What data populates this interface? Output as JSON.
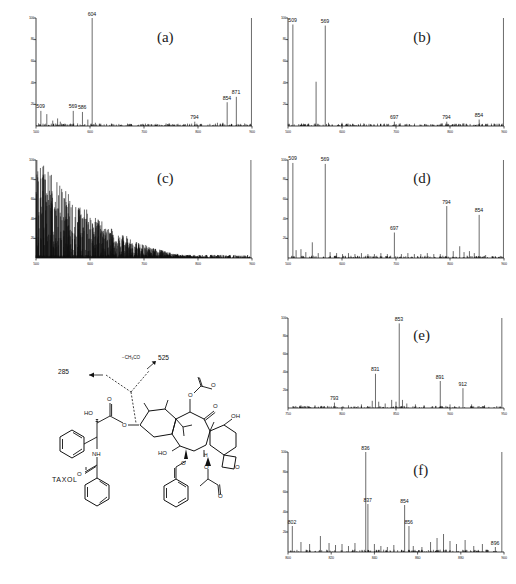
{
  "figure": {
    "kind": "mass-spectra-figure",
    "background": "#ffffff",
    "trace_color": "#111111",
    "axis_color": "#111111"
  },
  "structure": {
    "name": "TAXOL",
    "annotations": [
      {
        "name": "fragment-285",
        "text": "285"
      },
      {
        "name": "fragment-525",
        "text": "525"
      },
      {
        "name": "neutral-loss",
        "text": "−CH₃CO"
      }
    ],
    "atom_labels": [
      "HO",
      "O",
      "O",
      "O",
      "NH",
      "O",
      "OH",
      "O",
      "HO",
      "H",
      "O",
      "O",
      "O",
      "O",
      "O"
    ]
  },
  "panels": [
    {
      "id": "a",
      "label": "(a)",
      "xlabel": "",
      "ylabel": "",
      "xlim": [
        500,
        900
      ],
      "ylim": [
        0,
        100
      ],
      "xticks": [
        500,
        600,
        700,
        800,
        900
      ],
      "xticklabels": [
        "500",
        "600",
        "700",
        "800",
        "900"
      ],
      "yticks": [
        0,
        20,
        40,
        60,
        80,
        100
      ],
      "yticklabels": [
        "",
        "20",
        "40",
        "60",
        "80",
        "100"
      ],
      "labeled_peaks": [
        {
          "mz": 509,
          "intensity": 14
        },
        {
          "mz": 569,
          "intensity": 14
        },
        {
          "mz": 586,
          "intensity": 13
        },
        {
          "mz": 604,
          "intensity": 100
        },
        {
          "mz": 794,
          "intensity": 4
        },
        {
          "mz": 854,
          "intensity": 22
        },
        {
          "mz": 871,
          "intensity": 27
        }
      ],
      "unlabeled_peaks": [
        {
          "mz": 520,
          "intensity": 11
        },
        {
          "mz": 531,
          "intensity": 5
        },
        {
          "mz": 540,
          "intensity": 7
        },
        {
          "mz": 545,
          "intensity": 4
        },
        {
          "mz": 596,
          "intensity": 6
        },
        {
          "mz": 610,
          "intensity": 3
        },
        {
          "mz": 640,
          "intensity": 2
        },
        {
          "mz": 672,
          "intensity": 1
        },
        {
          "mz": 700,
          "intensity": 1
        },
        {
          "mz": 722,
          "intensity": 1
        },
        {
          "mz": 755,
          "intensity": 1
        },
        {
          "mz": 775,
          "intensity": 1
        },
        {
          "mz": 806,
          "intensity": 2
        },
        {
          "mz": 822,
          "intensity": 2
        },
        {
          "mz": 836,
          "intensity": 3
        },
        {
          "mz": 846,
          "intensity": 3
        },
        {
          "mz": 862,
          "intensity": 2
        },
        {
          "mz": 899,
          "intensity": 100
        }
      ]
    },
    {
      "id": "b",
      "label": "(b)",
      "xlim": [
        500,
        900
      ],
      "ylim": [
        0,
        100
      ],
      "xticks": [
        500,
        600,
        700,
        800,
        900
      ],
      "xticklabels": [
        "500",
        "600",
        "700",
        "800",
        "900"
      ],
      "yticks": [
        0,
        20,
        40,
        60,
        80,
        100
      ],
      "yticklabels": [
        "",
        "20",
        "40",
        "60",
        "80",
        "100"
      ],
      "labeled_peaks": [
        {
          "mz": 509,
          "intensity": 94
        },
        {
          "mz": 569,
          "intensity": 93
        },
        {
          "mz": 697,
          "intensity": 4
        },
        {
          "mz": 794,
          "intensity": 4
        },
        {
          "mz": 854,
          "intensity": 6
        }
      ],
      "unlabeled_peaks": [
        {
          "mz": 552,
          "intensity": 41
        },
        {
          "mz": 575,
          "intensity": 3
        },
        {
          "mz": 600,
          "intensity": 3
        },
        {
          "mz": 620,
          "intensity": 2
        },
        {
          "mz": 650,
          "intensity": 2
        },
        {
          "mz": 672,
          "intensity": 2
        },
        {
          "mz": 720,
          "intensity": 2
        },
        {
          "mz": 745,
          "intensity": 1
        },
        {
          "mz": 770,
          "intensity": 1
        },
        {
          "mz": 812,
          "intensity": 2
        },
        {
          "mz": 830,
          "intensity": 2
        },
        {
          "mz": 866,
          "intensity": 2
        },
        {
          "mz": 899,
          "intensity": 100
        }
      ]
    },
    {
      "id": "c",
      "label": "(c)",
      "xlim": [
        500,
        900
      ],
      "ylim": [
        0,
        100
      ],
      "xticks": [
        500,
        600,
        700,
        800,
        900
      ],
      "xticklabels": [
        "500",
        "600",
        "700",
        "800",
        "900"
      ],
      "yticks": [
        0,
        20,
        40,
        60,
        80,
        100
      ],
      "yticklabels": [
        "",
        "20",
        "40",
        "60",
        "80",
        "100"
      ],
      "labeled_peaks": [],
      "description": "dense unresolved chemical-noise spectrum, intensity decreasing toward high m/z",
      "unlabeled_peaks": []
    },
    {
      "id": "d",
      "label": "(d)",
      "xlim": [
        500,
        900
      ],
      "ylim": [
        0,
        100
      ],
      "xticks": [
        500,
        600,
        700,
        800,
        900
      ],
      "xticklabels": [
        "500",
        "600",
        "700",
        "800",
        "900"
      ],
      "yticks": [
        0,
        20,
        40,
        60,
        80,
        100
      ],
      "yticklabels": [
        "",
        "20",
        "40",
        "60",
        "80",
        "100"
      ],
      "labeled_peaks": [
        {
          "mz": 509,
          "intensity": 97
        },
        {
          "mz": 569,
          "intensity": 96
        },
        {
          "mz": 697,
          "intensity": 26
        },
        {
          "mz": 794,
          "intensity": 53
        },
        {
          "mz": 854,
          "intensity": 44
        }
      ],
      "unlabeled_peaks": [
        {
          "mz": 515,
          "intensity": 8
        },
        {
          "mz": 524,
          "intensity": 9
        },
        {
          "mz": 533,
          "intensity": 6
        },
        {
          "mz": 545,
          "intensity": 16
        },
        {
          "mz": 556,
          "intensity": 5
        },
        {
          "mz": 578,
          "intensity": 6
        },
        {
          "mz": 590,
          "intensity": 5
        },
        {
          "mz": 601,
          "intensity": 4
        },
        {
          "mz": 612,
          "intensity": 5
        },
        {
          "mz": 624,
          "intensity": 4
        },
        {
          "mz": 636,
          "intensity": 5
        },
        {
          "mz": 648,
          "intensity": 4
        },
        {
          "mz": 660,
          "intensity": 4
        },
        {
          "mz": 672,
          "intensity": 5
        },
        {
          "mz": 684,
          "intensity": 4
        },
        {
          "mz": 710,
          "intensity": 4
        },
        {
          "mz": 722,
          "intensity": 5
        },
        {
          "mz": 734,
          "intensity": 4
        },
        {
          "mz": 746,
          "intensity": 4
        },
        {
          "mz": 758,
          "intensity": 5
        },
        {
          "mz": 770,
          "intensity": 4
        },
        {
          "mz": 782,
          "intensity": 4
        },
        {
          "mz": 806,
          "intensity": 7
        },
        {
          "mz": 818,
          "intensity": 12
        },
        {
          "mz": 826,
          "intensity": 6
        },
        {
          "mz": 836,
          "intensity": 7
        },
        {
          "mz": 845,
          "intensity": 5
        },
        {
          "mz": 866,
          "intensity": 3
        },
        {
          "mz": 878,
          "intensity": 2
        },
        {
          "mz": 899,
          "intensity": 100
        }
      ]
    },
    {
      "id": "e",
      "label": "(e)",
      "xlim": [
        750,
        950
      ],
      "ylim": [
        0,
        100
      ],
      "xticks": [
        750,
        800,
        850,
        900,
        950
      ],
      "xticklabels": [
        "750",
        "800",
        "850",
        "900",
        "950"
      ],
      "yticks": [
        0,
        20,
        40,
        60,
        80,
        100
      ],
      "yticklabels": [
        "",
        "20",
        "40",
        "60",
        "80",
        "100"
      ],
      "labeled_peaks": [
        {
          "mz": 793,
          "intensity": 6
        },
        {
          "mz": 831,
          "intensity": 38
        },
        {
          "mz": 853,
          "intensity": 94
        },
        {
          "mz": 891,
          "intensity": 30
        },
        {
          "mz": 912,
          "intensity": 22
        }
      ],
      "unlabeled_peaks": [
        {
          "mz": 762,
          "intensity": 3
        },
        {
          "mz": 775,
          "intensity": 3
        },
        {
          "mz": 806,
          "intensity": 3
        },
        {
          "mz": 818,
          "intensity": 4
        },
        {
          "mz": 828,
          "intensity": 8
        },
        {
          "mz": 834,
          "intensity": 7
        },
        {
          "mz": 840,
          "intensity": 5
        },
        {
          "mz": 846,
          "intensity": 9
        },
        {
          "mz": 850,
          "intensity": 7
        },
        {
          "mz": 856,
          "intensity": 9
        },
        {
          "mz": 860,
          "intensity": 5
        },
        {
          "mz": 868,
          "intensity": 4
        },
        {
          "mz": 876,
          "intensity": 3
        },
        {
          "mz": 900,
          "intensity": 4
        },
        {
          "mz": 920,
          "intensity": 4
        },
        {
          "mz": 932,
          "intensity": 3
        },
        {
          "mz": 948,
          "intensity": 100
        }
      ]
    },
    {
      "id": "f",
      "label": "(f)",
      "xlim": [
        800,
        900
      ],
      "ylim": [
        0,
        100
      ],
      "xticks": [
        800,
        820,
        840,
        860,
        880,
        900
      ],
      "xticklabels": [
        "800",
        "820",
        "840",
        "860",
        "880",
        "900"
      ],
      "yticks": [
        0,
        20,
        40,
        60,
        80,
        100
      ],
      "yticklabels": [
        "",
        "20",
        "40",
        "60",
        "80",
        "100"
      ],
      "labeled_peaks": [
        {
          "mz": 802,
          "intensity": 26
        },
        {
          "mz": 836,
          "intensity": 100
        },
        {
          "mz": 837,
          "intensity": 48
        },
        {
          "mz": 854,
          "intensity": 47
        },
        {
          "mz": 856,
          "intensity": 26
        },
        {
          "mz": 896,
          "intensity": 5
        }
      ],
      "unlabeled_peaks": [
        {
          "mz": 806,
          "intensity": 10
        },
        {
          "mz": 810,
          "intensity": 8
        },
        {
          "mz": 815,
          "intensity": 16
        },
        {
          "mz": 819,
          "intensity": 9
        },
        {
          "mz": 822,
          "intensity": 7
        },
        {
          "mz": 825,
          "intensity": 8
        },
        {
          "mz": 828,
          "intensity": 6
        },
        {
          "mz": 831,
          "intensity": 9
        },
        {
          "mz": 840,
          "intensity": 8
        },
        {
          "mz": 843,
          "intensity": 6
        },
        {
          "mz": 846,
          "intensity": 5
        },
        {
          "mz": 849,
          "intensity": 7
        },
        {
          "mz": 858,
          "intensity": 6
        },
        {
          "mz": 862,
          "intensity": 5
        },
        {
          "mz": 866,
          "intensity": 10
        },
        {
          "mz": 869,
          "intensity": 14
        },
        {
          "mz": 872,
          "intensity": 18
        },
        {
          "mz": 875,
          "intensity": 11
        },
        {
          "mz": 878,
          "intensity": 8
        },
        {
          "mz": 882,
          "intensity": 12
        },
        {
          "mz": 886,
          "intensity": 6
        },
        {
          "mz": 890,
          "intensity": 8
        },
        {
          "mz": 899,
          "intensity": 100
        }
      ]
    }
  ]
}
